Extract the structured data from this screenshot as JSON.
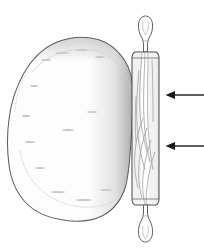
{
  "figure": {
    "title": "Rolling pin flattening a ball of dough",
    "background_color": "#ffffff",
    "canvas": {
      "width": 204,
      "height": 249
    }
  },
  "objects": {
    "dough": {
      "label": "dough",
      "outline_color": "#6b6b6b",
      "fill_color": "#fdfdfd",
      "shade_color": "#b9b9b9",
      "bounds": {
        "x": 8,
        "y": 38,
        "width": 124,
        "height": 184
      },
      "description": "irregular rounded mass of dough with stippled shading along its right edge"
    },
    "rolling_pin": {
      "label": "rolling pin",
      "outline_color": "#4a4a4a",
      "body_fill": "#fefefe",
      "grain_color": "#a9a9a9",
      "body": {
        "x": 131,
        "y": 52,
        "width": 29,
        "height": 153
      },
      "handle_top": {
        "x": 137,
        "y": 16,
        "width": 17,
        "height": 36
      },
      "handle_bottom": {
        "x": 137,
        "y": 205,
        "width": 17,
        "height": 38
      },
      "description": "wooden rolling pin shown vertically with turned handles and wood grain"
    }
  },
  "annotations": {
    "arrow_color": "#1a1a1a",
    "arrows": [
      {
        "name": "upper-direction-arrow",
        "label": "",
        "direction": "left",
        "tip": {
          "x": 166,
          "y": 95
        },
        "tail": {
          "x": 204,
          "y": 95
        }
      },
      {
        "name": "lower-direction-arrow",
        "label": "",
        "direction": "left",
        "tip": {
          "x": 166,
          "y": 146
        },
        "tail": {
          "x": 204,
          "y": 146
        }
      }
    ]
  }
}
